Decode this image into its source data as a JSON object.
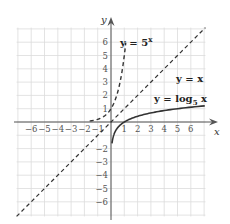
{
  "chart_data": {
    "type": "line",
    "title": "",
    "xlabel": "x",
    "ylabel": "y",
    "xlim": [
      -7,
      7
    ],
    "ylim": [
      -7,
      7
    ],
    "grid": true,
    "x_ticks": [
      -6,
      -5,
      -4,
      -3,
      -2,
      -1,
      1,
      2,
      3,
      4,
      5,
      6
    ],
    "y_ticks": [
      -6,
      -5,
      -4,
      -3,
      -2,
      1,
      2,
      3,
      4,
      5,
      6
    ],
    "x_tick_labels": [
      "−6",
      "−5",
      "−4",
      "−3",
      "−2",
      "−1",
      "1",
      "2",
      "3",
      "4",
      "5",
      "6"
    ],
    "y_tick_labels": [
      "−6",
      "−5",
      "−4",
      "−3",
      "−2",
      "1",
      "2",
      "3",
      "4",
      "5",
      "6"
    ],
    "series": [
      {
        "name": "y = 5^x",
        "label_main": "y = 5",
        "label_exp": "x",
        "style": "dashed",
        "function": "5^x",
        "x": [
          -6,
          -3,
          -2,
          -1,
          0,
          0.5,
          1,
          1.1
        ],
        "y": [
          0.0001,
          0.008,
          0.04,
          0.2,
          1,
          2.24,
          5,
          5.87
        ]
      },
      {
        "name": "y = x",
        "label": "y = x",
        "style": "dashed",
        "function": "x",
        "x": [
          -6.5,
          0,
          6.5
        ],
        "y": [
          -6.5,
          0,
          6.5
        ]
      },
      {
        "name": "y = log_5 x",
        "label_main": "y = log",
        "label_sub": "5",
        "label_tail": " x",
        "style": "solid",
        "function": "log5(x)",
        "x": [
          0.0001,
          0.008,
          0.04,
          0.2,
          1,
          2.24,
          5,
          6.8
        ],
        "y": [
          -5.7,
          -3,
          -2,
          -1,
          0,
          0.5,
          1,
          1.19
        ]
      }
    ],
    "legend": "inline labels near curves"
  },
  "colors": {
    "grid": "#dcdcdc",
    "axis": "#555555",
    "curve": "#333333"
  }
}
